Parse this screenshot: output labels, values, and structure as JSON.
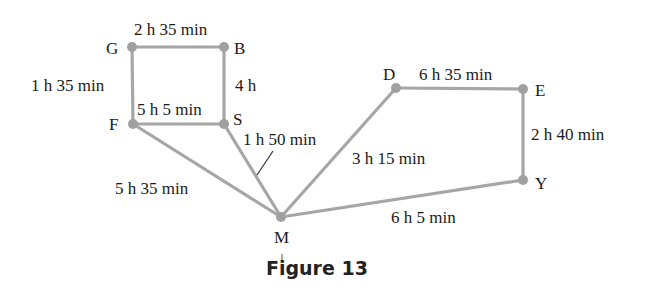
{
  "figure": {
    "caption": "Figure 13",
    "colors": {
      "edge": "#a6a6a6",
      "node": "#a0a0a0",
      "text": "#1a1a1a"
    },
    "nodes": [
      {
        "id": "G",
        "label": "G",
        "x": 132,
        "y": 47
      },
      {
        "id": "B",
        "label": "B",
        "x": 224,
        "y": 47
      },
      {
        "id": "F",
        "label": "F",
        "x": 133,
        "y": 124
      },
      {
        "id": "S",
        "label": "S",
        "x": 224,
        "y": 124
      },
      {
        "id": "M",
        "label": "M",
        "x": 281,
        "y": 217
      },
      {
        "id": "D",
        "label": "D",
        "x": 396,
        "y": 88
      },
      {
        "id": "E",
        "label": "E",
        "x": 523,
        "y": 89
      },
      {
        "id": "Y",
        "label": "Y",
        "x": 523,
        "y": 180
      }
    ],
    "edges": [
      {
        "from": "G",
        "to": "B",
        "weight": "2 h 35 min"
      },
      {
        "from": "G",
        "to": "F",
        "weight": "1 h 35 min"
      },
      {
        "from": "B",
        "to": "S",
        "weight": "4 h"
      },
      {
        "from": "F",
        "to": "S",
        "weight": "5 h 5 min"
      },
      {
        "from": "S",
        "to": "M",
        "weight": "1 h 50 min"
      },
      {
        "from": "F",
        "to": "M",
        "weight": "5 h 35 min"
      },
      {
        "from": "M",
        "to": "D",
        "weight": "3 h 15 min"
      },
      {
        "from": "D",
        "to": "E",
        "weight": "6 h 35 min"
      },
      {
        "from": "E",
        "to": "Y",
        "weight": "2 h 40 min"
      },
      {
        "from": "M",
        "to": "Y",
        "weight": "6 h 5 min"
      }
    ]
  }
}
